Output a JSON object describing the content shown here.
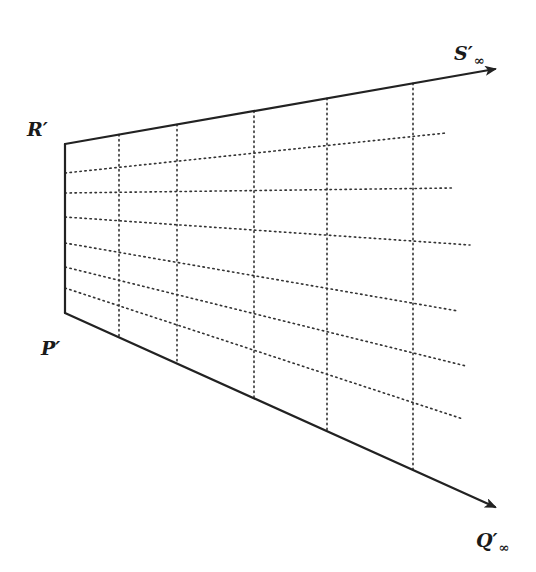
{
  "diagram": {
    "labels": {
      "r_prime": {
        "text": "R′",
        "x": 27,
        "y": 120
      },
      "p_prime": {
        "text": "P′",
        "x": 41,
        "y": 339
      },
      "s_inf": {
        "text": "S′",
        "sub": "∞",
        "x": 454,
        "y": 44
      },
      "q_inf": {
        "text": "Q′",
        "sub": "∞",
        "x": 476,
        "y": 531
      }
    },
    "colors": {
      "ink": "#222222",
      "background": "#ffffff"
    },
    "points": {
      "R": [
        65,
        144
      ],
      "P": [
        65,
        313
      ],
      "S_arrow_tip": [
        495,
        69
      ],
      "Q_arrow_tip": [
        495,
        507
      ]
    },
    "vertical_dotted_x": [
      119,
      177,
      254,
      327,
      413
    ],
    "horizontal_dotted_lines": [
      {
        "from": [
          65,
          173
        ],
        "to": [
          446,
          133
        ]
      },
      {
        "from": [
          65,
          193
        ],
        "to": [
          453,
          188
        ]
      },
      {
        "from": [
          65,
          217
        ],
        "to": [
          470,
          245
        ]
      },
      {
        "from": [
          65,
          243
        ],
        "to": [
          458,
          311
        ]
      },
      {
        "from": [
          65,
          267
        ],
        "to": [
          466,
          366
        ]
      },
      {
        "from": [
          65,
          288
        ],
        "to": [
          463,
          419
        ]
      }
    ]
  }
}
